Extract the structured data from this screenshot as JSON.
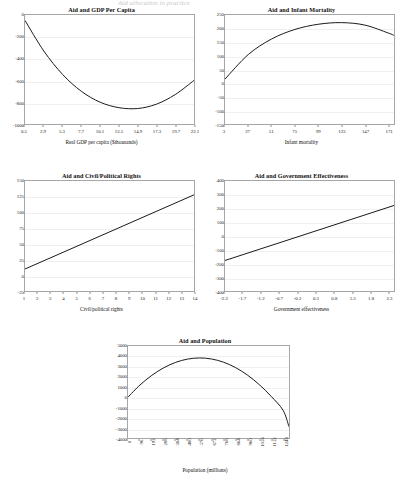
{
  "page": {
    "top_remnant": "Aid allocation in practice",
    "background_color": "#ffffff",
    "line_color": "#1a1a1a",
    "frame_color": "#a6a6a6",
    "grid_color": "#f0f0f0"
  },
  "chart_data": [
    {
      "id": "aid-gdp-per-capita",
      "type": "line",
      "title": "Aid and GDP Per Capita",
      "xlabel": "Real GDP per capita ($thousands)",
      "ylabel": "",
      "xlim": [
        0.5,
        22.1
      ],
      "ylim": [
        -1000,
        0
      ],
      "grid": true,
      "xticks": [
        "0.5",
        "2.9",
        "5.3",
        "7.7",
        "10.1",
        "12.5",
        "14.9",
        "17.3",
        "19.7",
        "22.1"
      ],
      "yticks": [
        "0",
        "-200",
        "-400",
        "-600",
        "-800",
        "-1000"
      ],
      "x": [
        0.5,
        2.9,
        5.3,
        7.7,
        10.1,
        12.5,
        14.9,
        17.3,
        19.7,
        22.1
      ],
      "values": [
        -50,
        -330,
        -545,
        -700,
        -800,
        -850,
        -858,
        -818,
        -730,
        -600
      ]
    },
    {
      "id": "aid-infant-mortality",
      "type": "line",
      "title": "Aid and Infant Mortality",
      "xlabel": "Infant mortality",
      "ylabel": "",
      "xlim": [
        3,
        177
      ],
      "ylim": [
        -150,
        250
      ],
      "grid": true,
      "xticks": [
        "3",
        "27",
        "51",
        "75",
        "99",
        "123",
        "147",
        "171"
      ],
      "yticks": [
        "250",
        "200",
        "150",
        "100",
        "50",
        "0",
        "-50",
        "-100",
        "-150"
      ],
      "x": [
        3,
        27,
        51,
        75,
        99,
        123,
        147,
        171,
        177
      ],
      "values": [
        15,
        105,
        162,
        197,
        216,
        222,
        213,
        184,
        175
      ]
    },
    {
      "id": "aid-civil-political-rights",
      "type": "line",
      "title": "Aid and Civil/Political Rights",
      "xlabel": "Civil/political rights",
      "ylabel": "",
      "xlim": [
        1,
        14
      ],
      "ylim": [
        -25,
        150
      ],
      "grid": true,
      "xticks": [
        "1",
        "2",
        "3",
        "4",
        "5",
        "6",
        "7",
        "8",
        "9",
        "10",
        "11",
        "12",
        "13",
        "14"
      ],
      "yticks": [
        "150",
        "125",
        "100",
        "75",
        "50",
        "25",
        "0",
        "-25"
      ],
      "x": [
        1,
        14
      ],
      "values": [
        10,
        128
      ]
    },
    {
      "id": "aid-government-effectiveness",
      "type": "line",
      "title": "Aid and Government Effectiveness",
      "xlabel": "Government effectiveness",
      "ylabel": "",
      "xlim": [
        -2.2,
        2.45
      ],
      "ylim": [
        -400,
        400
      ],
      "grid": true,
      "xticks": [
        "-2.2",
        "-1.7",
        "-1.2",
        "-0.7",
        "-0.2",
        "0.3",
        "0.8",
        "1.3",
        "1.8",
        "2.3"
      ],
      "yticks": [
        "400",
        "300",
        "200",
        "100",
        "0",
        "-100",
        "-200",
        "-300",
        "-400"
      ],
      "x": [
        -2.2,
        2.45
      ],
      "values": [
        -178,
        222
      ]
    },
    {
      "id": "aid-population",
      "type": "line",
      "title": "Aid and Population",
      "xlabel": "Population (millions)",
      "ylabel": "",
      "xlim": [
        0,
        1296
      ],
      "ylim": [
        -4000,
        5000
      ],
      "grid": true,
      "xticks": [
        "0",
        "96",
        "192",
        "288",
        "384",
        "480",
        "576",
        "672",
        "768",
        "864",
        "960",
        "1056",
        "1152",
        "1248"
      ],
      "yticks": [
        "5000",
        "4000",
        "3000",
        "2000",
        "1000",
        "0",
        "-1000",
        "-2000",
        "-3000",
        "-4000"
      ],
      "x": [
        0,
        96,
        192,
        288,
        384,
        480,
        576,
        672,
        768,
        864,
        960,
        1056,
        1152,
        1248,
        1296
      ],
      "values": [
        0,
        1180,
        2130,
        2870,
        3400,
        3720,
        3830,
        3730,
        3420,
        2900,
        2170,
        1230,
        80,
        -1280,
        -2900
      ]
    }
  ]
}
